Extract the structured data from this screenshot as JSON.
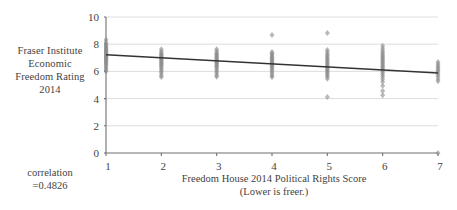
{
  "chart_data": {
    "type": "scatter",
    "title": "",
    "xlabel": "Freedom House 2014 Political Rights Score",
    "xlabel_note": "(Lower is freer.)",
    "ylabel": "Fraser Institute Economic Freedom Rating 2014",
    "xlim": [
      1,
      7
    ],
    "ylim": [
      0,
      10
    ],
    "xticks": [
      1,
      2,
      3,
      4,
      5,
      6,
      7
    ],
    "yticks": [
      0,
      2,
      4,
      6,
      8,
      10
    ],
    "xtick_labels": [
      "1",
      "2",
      "3",
      "4",
      "5",
      "6",
      "7"
    ],
    "ytick_labels": [
      "0",
      "2",
      "4",
      "6",
      "8",
      "10"
    ],
    "grid": "horizontal",
    "legend": "none",
    "marker": "diamond",
    "marker_color": "#8c8c8c",
    "trendline": {
      "color": "#333333",
      "x": [
        1,
        7
      ],
      "y": [
        7.22,
        5.88
      ]
    },
    "annotations": [
      {
        "text": "correlation",
        "position": "left-lower"
      },
      {
        "text": "=0.4826",
        "position": "left-lower"
      }
    ],
    "series": [
      {
        "name": "Countries",
        "points": [
          [
            1,
            8.32
          ],
          [
            1,
            8.12
          ],
          [
            1,
            8.02
          ],
          [
            1,
            7.92
          ],
          [
            1,
            7.84
          ],
          [
            1,
            7.76
          ],
          [
            1,
            7.68
          ],
          [
            1,
            7.62
          ],
          [
            1,
            7.56
          ],
          [
            1,
            7.5
          ],
          [
            1,
            7.44
          ],
          [
            1,
            7.38
          ],
          [
            1,
            7.32
          ],
          [
            1,
            7.26
          ],
          [
            1,
            7.2
          ],
          [
            1,
            7.14
          ],
          [
            1,
            7.08
          ],
          [
            1,
            7.02
          ],
          [
            1,
            6.96
          ],
          [
            1,
            6.9
          ],
          [
            1,
            6.84
          ],
          [
            1,
            6.78
          ],
          [
            1,
            6.7
          ],
          [
            1,
            6.62
          ],
          [
            1,
            6.54
          ],
          [
            1,
            6.44
          ],
          [
            1,
            6.34
          ],
          [
            1,
            6.22
          ],
          [
            1,
            6.1
          ],
          [
            1,
            6.0
          ],
          [
            2,
            7.62
          ],
          [
            2,
            7.46
          ],
          [
            2,
            7.34
          ],
          [
            2,
            7.24
          ],
          [
            2,
            7.16
          ],
          [
            2,
            7.08
          ],
          [
            2,
            7.0
          ],
          [
            2,
            6.92
          ],
          [
            2,
            6.84
          ],
          [
            2,
            6.76
          ],
          [
            2,
            6.68
          ],
          [
            2,
            6.6
          ],
          [
            2,
            6.52
          ],
          [
            2,
            6.44
          ],
          [
            2,
            6.34
          ],
          [
            2,
            6.24
          ],
          [
            2,
            6.12
          ],
          [
            2,
            6.0
          ],
          [
            2,
            5.86
          ],
          [
            2,
            5.7
          ],
          [
            2,
            5.58
          ],
          [
            3,
            7.62
          ],
          [
            3,
            7.48
          ],
          [
            3,
            7.36
          ],
          [
            3,
            7.26
          ],
          [
            3,
            7.18
          ],
          [
            3,
            7.1
          ],
          [
            3,
            7.02
          ],
          [
            3,
            6.94
          ],
          [
            3,
            6.86
          ],
          [
            3,
            6.78
          ],
          [
            3,
            6.7
          ],
          [
            3,
            6.62
          ],
          [
            3,
            6.54
          ],
          [
            3,
            6.46
          ],
          [
            3,
            6.36
          ],
          [
            3,
            6.26
          ],
          [
            3,
            6.14
          ],
          [
            3,
            6.02
          ],
          [
            3,
            5.88
          ],
          [
            3,
            5.72
          ],
          [
            3,
            5.6
          ],
          [
            4,
            8.68
          ],
          [
            4,
            7.42
          ],
          [
            4,
            7.32
          ],
          [
            4,
            7.22
          ],
          [
            4,
            7.12
          ],
          [
            4,
            7.02
          ],
          [
            4,
            6.94
          ],
          [
            4,
            6.86
          ],
          [
            4,
            6.78
          ],
          [
            4,
            6.7
          ],
          [
            4,
            6.62
          ],
          [
            4,
            6.54
          ],
          [
            4,
            6.46
          ],
          [
            4,
            6.38
          ],
          [
            4,
            6.28
          ],
          [
            4,
            6.18
          ],
          [
            4,
            6.06
          ],
          [
            4,
            5.94
          ],
          [
            4,
            5.8
          ],
          [
            4,
            5.66
          ],
          [
            4,
            5.58
          ],
          [
            5,
            8.82
          ],
          [
            5,
            7.58
          ],
          [
            5,
            7.42
          ],
          [
            5,
            7.28
          ],
          [
            5,
            7.16
          ],
          [
            5,
            7.04
          ],
          [
            5,
            6.94
          ],
          [
            5,
            6.84
          ],
          [
            5,
            6.74
          ],
          [
            5,
            6.64
          ],
          [
            5,
            6.54
          ],
          [
            5,
            6.44
          ],
          [
            5,
            6.34
          ],
          [
            5,
            6.24
          ],
          [
            5,
            6.14
          ],
          [
            5,
            6.04
          ],
          [
            5,
            5.94
          ],
          [
            5,
            5.84
          ],
          [
            5,
            5.72
          ],
          [
            5,
            5.6
          ],
          [
            5,
            5.46
          ],
          [
            5,
            4.12
          ],
          [
            6,
            7.88
          ],
          [
            6,
            7.7
          ],
          [
            6,
            7.54
          ],
          [
            6,
            7.4
          ],
          [
            6,
            7.28
          ],
          [
            6,
            7.16
          ],
          [
            6,
            7.06
          ],
          [
            6,
            6.96
          ],
          [
            6,
            6.86
          ],
          [
            6,
            6.76
          ],
          [
            6,
            6.66
          ],
          [
            6,
            6.56
          ],
          [
            6,
            6.46
          ],
          [
            6,
            6.36
          ],
          [
            6,
            6.26
          ],
          [
            6,
            6.16
          ],
          [
            6,
            6.04
          ],
          [
            6,
            5.92
          ],
          [
            6,
            5.78
          ],
          [
            6,
            5.62
          ],
          [
            6,
            5.44
          ],
          [
            6,
            5.24
          ],
          [
            6,
            4.94
          ],
          [
            6,
            4.56
          ],
          [
            6,
            4.24
          ],
          [
            7,
            6.7
          ],
          [
            7,
            6.54
          ],
          [
            7,
            6.4
          ],
          [
            7,
            6.28
          ],
          [
            7,
            6.16
          ],
          [
            7,
            6.04
          ],
          [
            7,
            5.92
          ],
          [
            7,
            5.78
          ],
          [
            7,
            5.62
          ],
          [
            7,
            5.44
          ],
          [
            7,
            5.28
          ],
          [
            7,
            0.0
          ]
        ]
      }
    ]
  },
  "labels": {
    "y_axis_lines": [
      "Fraser Institute",
      "Economic",
      "Freedom Rating",
      "2014"
    ],
    "correlation_lines": [
      "correlation",
      "=0.4826"
    ],
    "x_axis_lines": [
      "Freedom House 2014 Political Rights Score",
      "(Lower is freer.)"
    ],
    "bottom_caption": ""
  },
  "colors": {
    "marker": "#8c8c8c",
    "trendline": "#333333",
    "axis": "#6e6e6e",
    "gridline": "#d9d9d9",
    "text": "#3f3f3f",
    "background": "#ffffff"
  }
}
